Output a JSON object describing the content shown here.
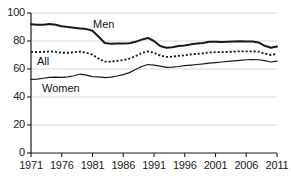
{
  "chart_data": {
    "type": "line",
    "title": "",
    "xlabel": "",
    "ylabel": "",
    "xlim": [
      1971,
      2011
    ],
    "ylim": [
      0,
      100
    ],
    "grid": true,
    "legend_position": "inline-annotations",
    "xticks": [
      "1971",
      "1976",
      "1981",
      "1986",
      "1991",
      "1996",
      "2001",
      "2006",
      "2011"
    ],
    "xtick_values": [
      1971,
      1976,
      1981,
      1986,
      1991,
      1996,
      2001,
      2006,
      2011
    ],
    "yticks": [
      "0",
      "20",
      "40",
      "60",
      "80",
      "100"
    ],
    "ytick_values": [
      0,
      20,
      40,
      60,
      80,
      100
    ],
    "x": [
      1971,
      1972,
      1973,
      1974,
      1975,
      1976,
      1977,
      1978,
      1979,
      1980,
      1981,
      1982,
      1983,
      1984,
      1985,
      1986,
      1987,
      1988,
      1989,
      1990,
      1991,
      1992,
      1993,
      1994,
      1995,
      1996,
      1997,
      1998,
      1999,
      2000,
      2001,
      2002,
      2003,
      2004,
      2005,
      2006,
      2007,
      2008,
      2009,
      2010,
      2011
    ],
    "series": [
      {
        "name": "Men",
        "style": "solid",
        "color": "#1a1a1a",
        "width": 2.0,
        "values": [
          92.0,
          91.6,
          91.6,
          92.2,
          91.6,
          90.6,
          90.0,
          89.5,
          89.0,
          88.5,
          87.3,
          83.0,
          78.6,
          78.0,
          78.2,
          78.2,
          78.4,
          79.4,
          81.0,
          82.2,
          80.0,
          76.4,
          75.2,
          75.6,
          76.4,
          76.8,
          77.6,
          78.2,
          78.6,
          79.4,
          79.4,
          79.2,
          79.4,
          79.6,
          79.8,
          79.6,
          79.6,
          79.0,
          76.6,
          75.2,
          76.0
        ]
      },
      {
        "name": "All",
        "style": "dotted",
        "color": "#1a1a1a",
        "width": 1.8,
        "values": [
          72.4,
          72.0,
          72.2,
          72.6,
          72.2,
          71.6,
          71.6,
          72.0,
          72.4,
          71.6,
          70.2,
          67.4,
          65.2,
          65.2,
          65.8,
          66.4,
          67.4,
          69.2,
          71.4,
          72.6,
          71.6,
          69.6,
          68.6,
          68.8,
          69.4,
          69.8,
          70.4,
          70.8,
          71.2,
          71.8,
          72.0,
          72.0,
          72.2,
          72.4,
          72.6,
          72.6,
          72.6,
          72.4,
          71.0,
          70.0,
          70.8
        ]
      },
      {
        "name": "Women",
        "style": "solid",
        "color": "#1a1a1a",
        "width": 1.2,
        "values": [
          52.6,
          52.8,
          53.4,
          54.0,
          54.2,
          54.0,
          54.4,
          55.2,
          56.4,
          55.6,
          54.6,
          54.4,
          53.8,
          54.2,
          55.0,
          56.0,
          57.4,
          59.6,
          61.8,
          63.2,
          62.8,
          62.0,
          61.2,
          61.4,
          61.8,
          62.4,
          62.8,
          63.2,
          63.6,
          64.2,
          64.6,
          65.0,
          65.4,
          65.8,
          66.2,
          66.6,
          66.8,
          66.6,
          66.0,
          65.0,
          65.6
        ]
      }
    ],
    "annotations": [
      {
        "text": "Men",
        "x_px": 93,
        "y_px": 18
      },
      {
        "text": "All",
        "x_px": 37,
        "y_px": 55
      },
      {
        "text": "Women",
        "x_px": 42,
        "y_px": 82
      }
    ]
  }
}
